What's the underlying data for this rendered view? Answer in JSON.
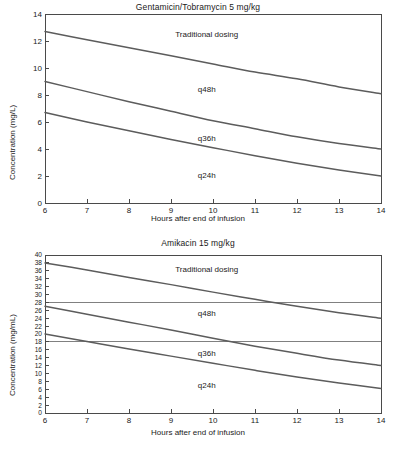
{
  "figure": {
    "panels": [
      {
        "id": "top",
        "title": "Gentamicin/Tobramycin 5 mg/kg",
        "xlabel": "Hours after end of infusion",
        "ylabel": "Concentration (mg/L)",
        "labels": {
          "traditional": "Traditional dosing",
          "q48h": "q48h",
          "q36h": "q36h",
          "q24h": "q24h"
        }
      },
      {
        "id": "bottom",
        "title": "Amikacin 15 mg/kg",
        "xlabel": "Hours after end of infusion",
        "ylabel": "Concentration (mg/mL)",
        "labels": {
          "traditional": "Traditional dosing",
          "q48h": "q48h",
          "q36h": "q36h",
          "q24h": "q24h"
        }
      }
    ]
  },
  "chart_data": [
    {
      "type": "line",
      "title": "Gentamicin/Tobramycin 5 mg/kg",
      "xlabel": "Hours after end of infusion",
      "ylabel": "Concentration (mg/L)",
      "xlim": [
        6,
        14
      ],
      "ylim": [
        0,
        14
      ],
      "xticks": [
        6,
        7,
        8,
        9,
        10,
        11,
        12,
        13,
        14
      ],
      "yticks": [
        0,
        2,
        4,
        6,
        8,
        10,
        12,
        14
      ],
      "grid": false,
      "legend_position": "inline-annotations",
      "annotations": [
        {
          "text": "Traditional dosing",
          "x": 9.85,
          "y": 12.3
        },
        {
          "text": "q48h",
          "x": 9.85,
          "y": 8.2
        },
        {
          "text": "q36h",
          "x": 9.85,
          "y": 4.6
        },
        {
          "text": "q24h",
          "x": 9.85,
          "y": 1.85
        }
      ],
      "reference_lines": [],
      "x": [
        6,
        7,
        8,
        9,
        10,
        11,
        12,
        13,
        14
      ],
      "series": [
        {
          "name": "Upper decay curve (above Traditional dosing band)",
          "values": [
            12.7,
            12.1,
            11.5,
            10.9,
            10.3,
            9.7,
            9.2,
            8.6,
            8.1
          ]
        },
        {
          "name": "Middle decay curve (above q48h band)",
          "values": [
            9.0,
            8.25,
            7.5,
            6.8,
            6.1,
            5.5,
            4.9,
            4.4,
            4.0
          ]
        },
        {
          "name": "Lower decay curve (above q36h band)",
          "values": [
            6.7,
            6.0,
            5.35,
            4.7,
            4.1,
            3.5,
            2.95,
            2.45,
            2.0
          ]
        }
      ]
    },
    {
      "type": "line",
      "title": "Amikacin 15 mg/kg",
      "xlabel": "Hours after end of infusion",
      "ylabel": "Concentration (mg/mL)",
      "xlim": [
        6,
        14
      ],
      "ylim": [
        0,
        40
      ],
      "xticks": [
        6,
        7,
        8,
        9,
        10,
        11,
        12,
        13,
        14
      ],
      "yticks": [
        0,
        2,
        4,
        6,
        8,
        10,
        12,
        14,
        16,
        18,
        20,
        22,
        24,
        26,
        28,
        30,
        32,
        34,
        36,
        38,
        40
      ],
      "grid": false,
      "legend_position": "inline-annotations",
      "annotations": [
        {
          "text": "Traditional dosing",
          "x": 9.85,
          "y": 35.7
        },
        {
          "text": "q48h",
          "x": 9.85,
          "y": 24.6
        },
        {
          "text": "q36h",
          "x": 9.85,
          "y": 14.4
        },
        {
          "text": "q24h",
          "x": 9.85,
          "y": 6.3
        }
      ],
      "reference_lines": [
        {
          "y": 28,
          "orientation": "horizontal"
        },
        {
          "y": 18,
          "orientation": "horizontal"
        }
      ],
      "x": [
        6,
        7,
        8,
        9,
        10,
        11,
        12,
        13,
        14
      ],
      "series": [
        {
          "name": "Upper decay curve (above Traditional dosing band)",
          "values": [
            38.0,
            36.2,
            34.3,
            32.5,
            30.6,
            28.8,
            27.0,
            25.4,
            24.0
          ]
        },
        {
          "name": "Middle decay curve (above q48h band)",
          "values": [
            27.0,
            25.0,
            23.0,
            21.0,
            18.9,
            16.9,
            15.1,
            13.4,
            12.0
          ]
        },
        {
          "name": "Lower decay curve (above q36h band)",
          "values": [
            20.0,
            18.1,
            16.2,
            14.4,
            12.6,
            10.8,
            9.1,
            7.6,
            6.2
          ]
        }
      ]
    }
  ]
}
